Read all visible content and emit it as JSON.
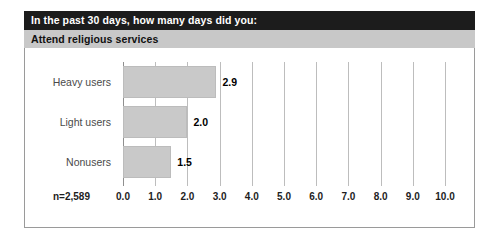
{
  "header": {
    "question_prefix": "In the past 30 days, how many ",
    "question_emphasis": "days",
    "question_suffix": " did you:",
    "topic": "Attend religious services"
  },
  "footnote": {
    "sample_size": "n=2,589"
  },
  "colors": {
    "header_bar": "#1c1c1c",
    "topic_bar": "#c8c8c8",
    "bar_fill": "#c9c9c9",
    "gridline": "#bdbdbd",
    "frame_border": "#9a9a9a"
  },
  "chart_data": {
    "type": "bar",
    "orientation": "horizontal",
    "title": "Attend religious services",
    "subtitle": "In the past 30 days, how many days did you:",
    "categories": [
      "Heavy users",
      "Light users",
      "Nonusers"
    ],
    "values": [
      2.9,
      2.0,
      1.5
    ],
    "value_labels": [
      "2.9",
      "2.0",
      "1.5"
    ],
    "xlabel": "",
    "ylabel": "",
    "xlim": [
      0,
      10
    ],
    "xticks": [
      0,
      1,
      2,
      3,
      4,
      5,
      6,
      7,
      8,
      9,
      10
    ],
    "xtick_labels": [
      "0.0",
      "1.0",
      "2.0",
      "3.0",
      "4.0",
      "5.0",
      "6.0",
      "7.0",
      "8.0",
      "9.0",
      "10.0"
    ],
    "grid": true,
    "grid_axis": "x",
    "legend": false,
    "annotations": [
      "n=2,589"
    ]
  }
}
